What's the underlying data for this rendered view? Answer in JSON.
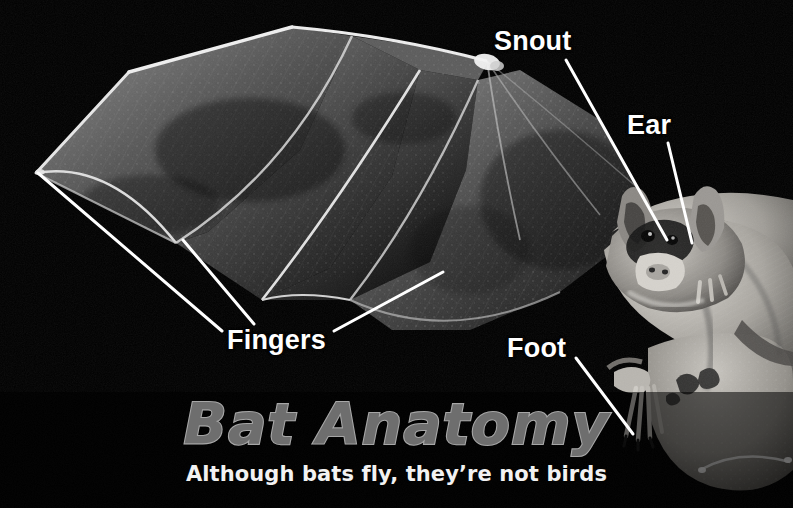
{
  "image": {
    "subject": "bat-anatomy-photo-diagram",
    "background_color": "#000000",
    "width": 793,
    "height": 508
  },
  "callouts": [
    {
      "id": "snout",
      "label": "Snout",
      "color": "#ffffff"
    },
    {
      "id": "ear",
      "label": "Ear",
      "color": "#ffffff"
    },
    {
      "id": "fingers",
      "label": "Fingers",
      "color": "#ffffff"
    },
    {
      "id": "foot",
      "label": "Foot",
      "color": "#ffffff"
    }
  ],
  "leader_lines": [
    {
      "for": "snout",
      "x1": 566,
      "y1": 60,
      "x2": 667,
      "y2": 240
    },
    {
      "for": "ear",
      "x1": 668,
      "y1": 143,
      "x2": 692,
      "y2": 243
    },
    {
      "for": "fingers",
      "x1": 38,
      "y1": 173,
      "x2": 222,
      "y2": 331
    },
    {
      "for": "fingers",
      "x1": 183,
      "y1": 240,
      "x2": 254,
      "y2": 324
    },
    {
      "for": "fingers",
      "x1": 443,
      "y1": 272,
      "x2": 334,
      "y2": 331
    },
    {
      "for": "foot",
      "x1": 576,
      "y1": 358,
      "x2": 633,
      "y2": 434
    }
  ],
  "title": {
    "main": "Bat Anatomy",
    "subtitle": "Although bats fly, they’re not birds",
    "main_fill_color": "#6e6e6e",
    "main_outline_color": "#a8a8a8",
    "subtitle_color": "#f2f2f2"
  }
}
